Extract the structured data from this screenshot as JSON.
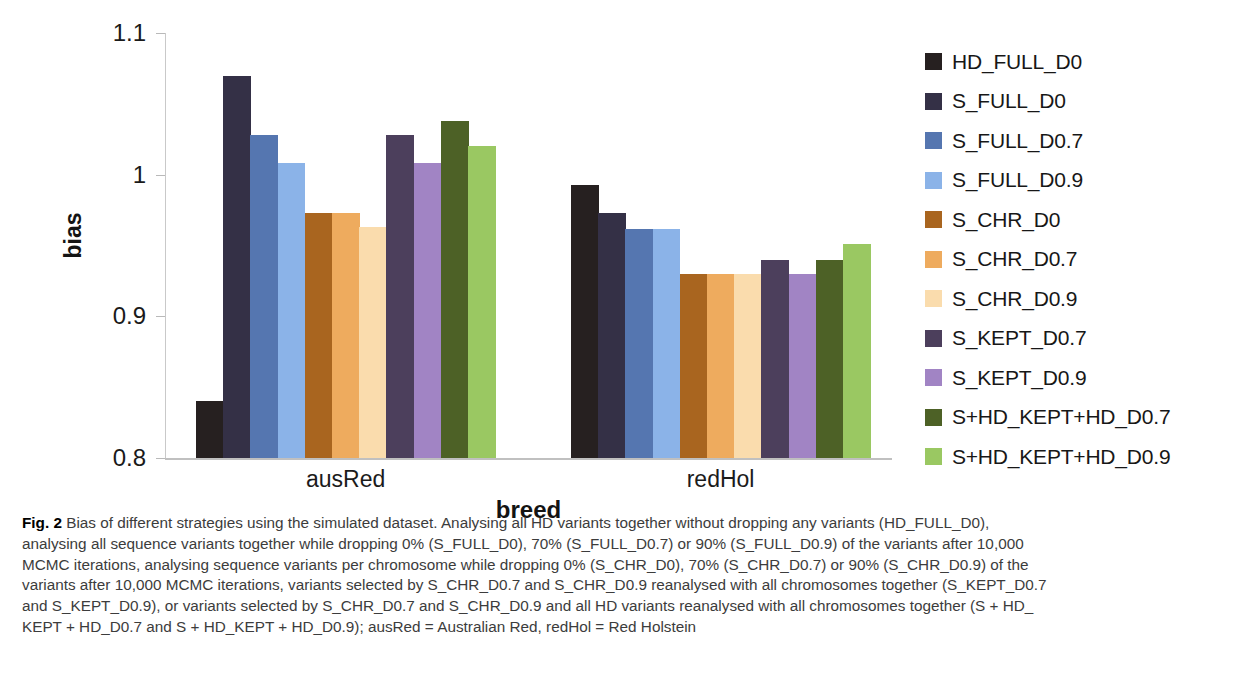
{
  "chart_data": {
    "type": "bar",
    "title": "",
    "xlabel": "breed",
    "ylabel": "bias",
    "categories": [
      "ausRed",
      "redHol"
    ],
    "ylim": [
      0.8,
      1.1
    ],
    "yticks": [
      "0.8",
      "0.9",
      "1",
      "1.1"
    ],
    "ytick_values": [
      0.8,
      0.9,
      1.0,
      1.1
    ],
    "grid": false,
    "legend_position": "right",
    "series": [
      {
        "name": "HD_FULL_D0",
        "color": "#262020",
        "values": [
          0.84,
          0.993
        ]
      },
      {
        "name": "S_FULL_D0",
        "color": "#343046",
        "values": [
          1.07,
          0.973
        ]
      },
      {
        "name": "S_FULL_D0.7",
        "color": "#5576b0",
        "values": [
          1.028,
          0.962
        ]
      },
      {
        "name": "S_FULL_D0.9",
        "color": "#8bb3e8",
        "values": [
          1.008,
          0.962
        ]
      },
      {
        "name": "S_CHR_D0",
        "color": "#a9651f",
        "values": [
          0.973,
          0.93
        ]
      },
      {
        "name": "S_CHR_D0.7",
        "color": "#eba košt",
        "values": [
          0.973,
          0.93
        ]
      },
      {
        "name": "S_CHR_D0.9",
        "color": "#fadcad",
        "values": [
          0.963,
          0.93
        ]
      },
      {
        "name": "S_KEPT_D0.7",
        "color": "#4c3f5c",
        "values": [
          1.028,
          0.94
        ]
      },
      {
        "name": "S_KEPT_D0.9",
        "color": "#a184c4",
        "values": [
          1.008,
          0.93
        ]
      },
      {
        "name": "S+HD_KEPT+HD_D0.7",
        "color": "#4d6126",
        "values": [
          1.038,
          0.94
        ]
      },
      {
        "name": "S+HD_KEPT+HD_D0.9",
        "color": "#9ac862",
        "values": [
          1.02,
          0.951
        ]
      }
    ]
  },
  "legend": {
    "items": [
      {
        "label": "HD_FULL_D0",
        "color": "#262020"
      },
      {
        "label": "S_FULL_D0",
        "color": "#343046"
      },
      {
        "label": "S_FULL_D0.7",
        "color": "#5576b0"
      },
      {
        "label": "S_FULL_D0.9",
        "color": "#8bb3e8"
      },
      {
        "label": "S_CHR_D0",
        "color": "#a9651f"
      },
      {
        "label": "S_CHR_D0.7",
        "color": "#eeab5e"
      },
      {
        "label": "S_CHR_D0.9",
        "color": "#fadcad"
      },
      {
        "label": "S_KEPT_D0.7",
        "color": "#4c3f5c"
      },
      {
        "label": "S_KEPT_D0.9",
        "color": "#a184c4"
      },
      {
        "label": "S+HD_KEPT+HD_D0.7",
        "color": "#4d6126"
      },
      {
        "label": "S+HD_KEPT+HD_D0.9",
        "color": "#9ac862"
      }
    ]
  },
  "caption": {
    "figure_number": "Fig. 2",
    "lines": [
      "Bias of different strategies using the simulated dataset. Analysing all HD variants together without dropping any variants (HD_FULL_D0),",
      "analysing all sequence variants together while dropping 0% (S_FULL_D0), 70% (S_FULL_D0.7) or 90% (S_FULL_D0.9) of the variants after 10,000",
      "MCMC iterations, analysing sequence variants per chromosome while dropping 0% (S_CHR_D0), 70% (S_CHR_D0.7) or 90% (S_CHR_D0.9) of the",
      "variants after 10,000 MCMC iterations, variants selected by S_CHR_D0.7 and S_CHR_D0.9 reanalysed with all chromosomes together (S_KEPT_D0.7",
      "and S_KEPT_D0.9), or variants selected by S_CHR_D0.7 and S_CHR_D0.9 and all HD variants reanalysed with all chromosomes together (S + HD_",
      "KEPT + HD_D0.7 and S + HD_KEPT + HD_D0.9); ausRed = Australian Red, redHol = Red Holstein"
    ]
  }
}
